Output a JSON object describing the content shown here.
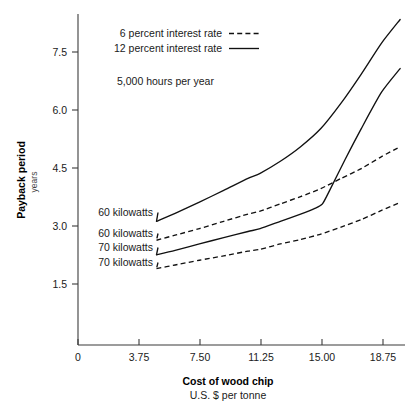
{
  "chart_data": {
    "type": "line",
    "title": "",
    "subtitle": "",
    "annotation_note": "5,000 hours per year",
    "xlabel": "Cost of wood chip",
    "xlabel_sub": "U.S. $ per tonne",
    "ylabel": "Payback period",
    "ylabel_sub": "years",
    "xlim": [
      0,
      20.2
    ],
    "ylim": [
      0,
      9.1
    ],
    "xticks": [
      0,
      3.75,
      7.5,
      11.25,
      15.0,
      18.75
    ],
    "xtick_labels": [
      "0",
      "3.75",
      "7.50",
      "11.25",
      "15.00",
      "18.75"
    ],
    "yticks": [
      1.5,
      3.0,
      4.5,
      6.0,
      7.5
    ],
    "ytick_labels": [
      "1.5",
      "3.0",
      "4.5",
      "6.0",
      "7.5"
    ],
    "grid": false,
    "legend_position": "top-left",
    "legend": [
      {
        "label": "6 percent interest rate",
        "style": "dashed"
      },
      {
        "label": "12 percent interest rate",
        "style": "solid"
      }
    ],
    "series": [
      {
        "name": "60 kilowatts",
        "interest_rate": "12 percent",
        "style": "solid",
        "label": "60 kilowatts",
        "x": [
          4.85,
          6.0,
          7.5,
          9.0,
          10.5,
          11.25,
          12.5,
          13.75,
          15.0,
          16.25,
          17.5,
          18.75,
          19.9
        ],
        "y": [
          3.4,
          3.62,
          3.93,
          4.25,
          4.58,
          4.72,
          5.05,
          5.45,
          5.95,
          6.65,
          7.45,
          8.3,
          8.95
        ]
      },
      {
        "name": "70 kilowatts",
        "interest_rate": "12 percent",
        "style": "solid",
        "label": "70 kilowatts",
        "x": [
          4.85,
          6.0,
          7.5,
          9.0,
          10.5,
          11.25,
          12.5,
          13.75,
          14.6,
          15.1,
          15.6,
          16.5,
          17.5,
          18.75,
          19.9
        ],
        "y": [
          2.48,
          2.6,
          2.78,
          2.95,
          3.12,
          3.2,
          3.4,
          3.6,
          3.75,
          3.88,
          4.3,
          5.1,
          5.95,
          6.95,
          7.6
        ]
      },
      {
        "name": "60 kilowatts",
        "interest_rate": "6 percent",
        "style": "dashed",
        "label": "60 kilowatts",
        "x": [
          4.85,
          6.0,
          7.5,
          9.0,
          10.5,
          11.25,
          12.5,
          13.75,
          15.0,
          16.25,
          17.5,
          18.75,
          19.9
        ],
        "y": [
          2.88,
          3.02,
          3.2,
          3.4,
          3.6,
          3.68,
          3.88,
          4.08,
          4.3,
          4.58,
          4.85,
          5.18,
          5.45
        ]
      },
      {
        "name": "70 kilowatts",
        "interest_rate": "6 percent",
        "style": "dashed",
        "label": "70 kilowatts",
        "x": [
          4.85,
          6.0,
          7.5,
          9.0,
          10.5,
          11.25,
          12.5,
          13.75,
          15.0,
          16.25,
          17.5,
          18.75,
          19.9
        ],
        "y": [
          2.1,
          2.2,
          2.33,
          2.45,
          2.58,
          2.63,
          2.78,
          2.9,
          3.05,
          3.24,
          3.45,
          3.7,
          3.92
        ]
      }
    ],
    "series_labels": [
      {
        "text": "60 kilowatts",
        "for": "60 kilowatts 12 percent"
      },
      {
        "text": "60 kilowatts",
        "for": "60 kilowatts 6 percent"
      },
      {
        "text": "70 kilowatts",
        "for": "70 kilowatts 12 percent"
      },
      {
        "text": "70 kilowatts",
        "for": "70 kilowatts 6 percent"
      }
    ],
    "colors": {
      "line": "#111111",
      "axis": "#3b3b3b",
      "text": "#1a1a1a",
      "background": "#ffffff"
    }
  }
}
